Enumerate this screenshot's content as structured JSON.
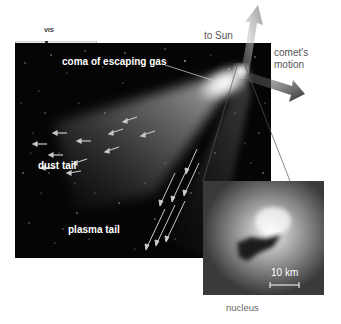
{
  "figure": {
    "spectrum_band_label": "VIS",
    "labels": {
      "coma": "coma of escaping gas",
      "dust_tail": "dust tail",
      "plasma_tail": "plasma tail",
      "to_sun": "to Sun",
      "comet_motion_line1": "comet's",
      "comet_motion_line2": "motion",
      "inset_scale": "10 km",
      "inset_caption": "nucleus"
    },
    "colors": {
      "sky_background": "#050505",
      "coma_glow": "#ffffff",
      "arrows": "#bdbdbd",
      "sun_arrow": "#9a9a9a",
      "motion_arrow": "#333333",
      "caption_text": "#555555"
    }
  }
}
